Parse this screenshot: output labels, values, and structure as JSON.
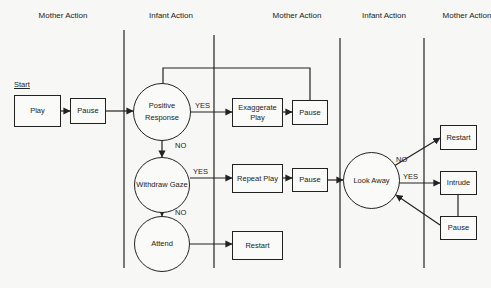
{
  "headers": [
    "Mother Action",
    "Infant Action",
    "Mother Action",
    "Infant Action",
    "Mother Action"
  ],
  "start_label": "Start",
  "nodes": {
    "play": "Play",
    "pause1": "Pause",
    "positive_response": "Positive Response",
    "withdraw_gaze": "Withdraw Gaze",
    "attend": "Attend",
    "exaggerate_play": "Exaggerate Play",
    "pause2": "Pause",
    "repeat_play": "Repeat Play",
    "pause3": "Pause",
    "restart1": "Restart",
    "look_away": "Look Away",
    "restart2": "Restart",
    "intrude": "Intrude",
    "pause4": "Pause"
  },
  "edge_labels": {
    "pr_yes": "YES",
    "pr_no": "NO",
    "wg_yes": "YES",
    "wg_no": "NO",
    "la_no": "NO",
    "la_yes": "YES"
  }
}
